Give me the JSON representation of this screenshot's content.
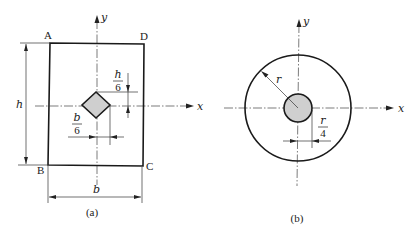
{
  "figure_a": {
    "caption": "(a)",
    "corners": {
      "top_left": "A",
      "top_right": "D",
      "bottom_left": "B",
      "bottom_right": "C"
    },
    "axes": {
      "x": "x",
      "y": "y"
    },
    "dims": {
      "height": "h",
      "width": "b",
      "offset_v_num": "h",
      "offset_v_den": "6",
      "offset_h_num": "b",
      "offset_h_den": "6"
    },
    "hole_shape": "square rotated 45° (diamond)",
    "hole_fill": "#cfcfcf"
  },
  "figure_b": {
    "caption": "(b)",
    "axes": {
      "x": "x",
      "y": "y"
    },
    "dims": {
      "radius": "r",
      "offset_num": "r",
      "offset_den": "4"
    },
    "hole_shape": "circle",
    "hole_fill": "#cfcfcf"
  }
}
